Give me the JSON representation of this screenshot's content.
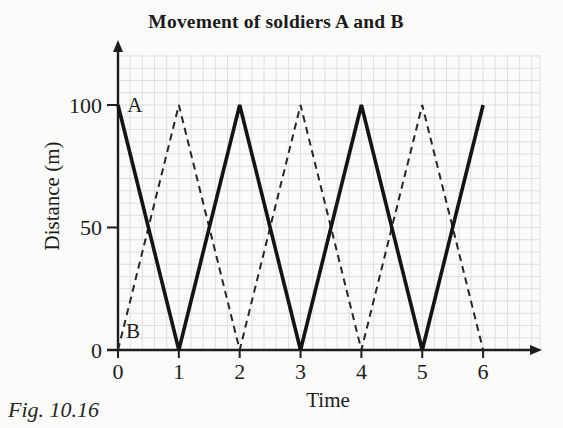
{
  "page": {
    "background_color": "#fbfbf9",
    "ink_color": "#1d1d1d",
    "grid_color": "#d9d9d9"
  },
  "figure": {
    "title": "Movement of soldiers A and B",
    "caption": "Fig. 10.16",
    "xlabel": "Time",
    "ylabel": "Distance (m)"
  },
  "chart_data": {
    "type": "line",
    "title": "Movement of soldiers A and B",
    "xlabel": "Time",
    "ylabel": "Distance (m)",
    "x_ticks": [
      0,
      1,
      2,
      3,
      4,
      5,
      6
    ],
    "y_ticks": [
      0,
      50,
      100
    ],
    "xlim": [
      0,
      6.9
    ],
    "ylim": [
      0,
      120
    ],
    "grid": true,
    "grid_minor_per_x_unit": 5,
    "grid_minor_per_y_50": 10,
    "legend_position": "in-plot letter annotations",
    "series": [
      {
        "name": "A",
        "line_style": "solid",
        "color": "#141414",
        "x": [
          0,
          1,
          2,
          3,
          4,
          5,
          6
        ],
        "values": [
          100,
          0,
          100,
          0,
          100,
          0,
          100
        ]
      },
      {
        "name": "B",
        "line_style": "dashed",
        "color": "#262626",
        "x": [
          0,
          1,
          2,
          3,
          4,
          5,
          6
        ],
        "values": [
          0,
          100,
          0,
          100,
          0,
          100,
          0
        ]
      }
    ],
    "annotations": [
      {
        "text": "A",
        "x": 0.15,
        "y": 97
      },
      {
        "text": "B",
        "x": 0.13,
        "y": 5
      }
    ]
  }
}
